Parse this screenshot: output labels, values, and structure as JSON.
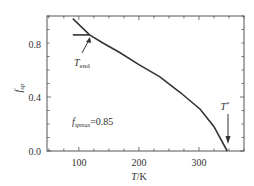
{
  "chart_data": {
    "type": "line",
    "title": "",
    "xlabel": "T/K",
    "ylabel": "f_sp",
    "xlim": [
      47,
      375
    ],
    "ylim": [
      0.0,
      1.0
    ],
    "xticks_major": [
      100,
      200,
      300
    ],
    "xticks_minor_step": 25,
    "yticks_major": [
      0.0,
      0.4,
      0.8
    ],
    "yticks_minor_step": 0.1,
    "grid": false,
    "legend": null,
    "series": [
      {
        "name": "f_sp(T)",
        "color": "#333333",
        "points": [
          [
            90,
            0.98
          ],
          [
            118,
            0.86
          ],
          [
            140,
            0.8
          ],
          [
            168,
            0.73
          ],
          [
            200,
            0.64
          ],
          [
            235,
            0.55
          ],
          [
            270,
            0.43
          ],
          [
            302,
            0.31
          ],
          [
            325,
            0.18
          ],
          [
            347,
            0.0
          ]
        ]
      },
      {
        "name": "f_spmax plateau",
        "color": "#333333",
        "points": [
          [
            90,
            0.86
          ],
          [
            118,
            0.86
          ]
        ]
      }
    ],
    "annotations": [
      {
        "id": "tend",
        "text_main": "T",
        "text_sub": "end",
        "points_to": [
          118,
          0.86
        ]
      },
      {
        "id": "tstar",
        "text_main": "T",
        "text_sup": "*",
        "points_to": [
          347,
          0.0
        ]
      },
      {
        "id": "fmax",
        "text_main": "f",
        "text_sub": "spmax",
        "text_rest": "=0.85",
        "at": [
          95,
          0.38
        ]
      }
    ]
  },
  "labels": {
    "x_ticks": [
      "100",
      "200",
      "300"
    ],
    "y_ticks": [
      "0.0",
      "0.4",
      "0.8"
    ],
    "x_axis_main": "T",
    "x_axis_rest": "/K",
    "y_axis_main": "f",
    "y_axis_sub": "sp",
    "tend_main": "T",
    "tend_sub": "end",
    "tstar_main": "T",
    "tstar_sup": "*",
    "fmax_main": "f",
    "fmax_sub": "spmax",
    "fmax_rest": "=0.85"
  }
}
